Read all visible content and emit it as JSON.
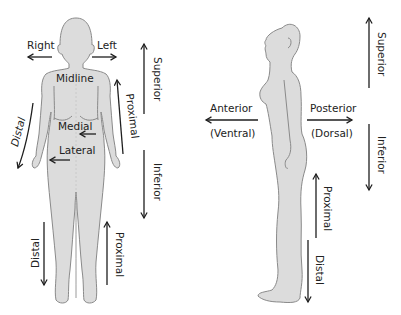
{
  "diagram": {
    "colors": {
      "body_fill": "#dcdcdc",
      "body_stroke": "#8a8a8a",
      "arrow": "#1e1e1e",
      "text": "#222222",
      "background": "#ffffff"
    },
    "front_view": {
      "labels": {
        "right": "Right",
        "left": "Left",
        "midline": "Midline",
        "medial": "Medial",
        "lateral": "Lateral",
        "superior": "Superior",
        "inferior": "Inferior",
        "proximal_arm": "Proximal",
        "distal_arm": "Distal",
        "proximal_leg": "Proximal",
        "distal_leg": "Distal"
      }
    },
    "side_view": {
      "labels": {
        "anterior": "Anterior",
        "ventral": "(Ventral)",
        "posterior": "Posterior",
        "dorsal": "(Dorsal)",
        "superior": "Superior",
        "inferior": "Inferior",
        "proximal": "Proximal",
        "distal": "Distal"
      }
    }
  }
}
